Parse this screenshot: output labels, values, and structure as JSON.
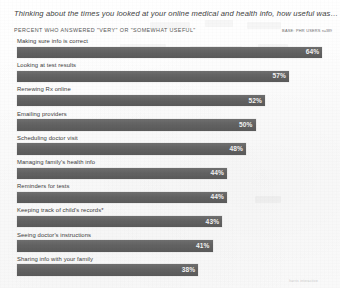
{
  "header": {
    "title": "Thinking about the times you looked at your online medical and health info, how useful was…",
    "subtitle": "PERCENT WHO ANSWERED \"VERY\" OR \"SOMEWHAT USEFUL\"",
    "base_label": "BASE: PHR USERS",
    "base_n": "n=389"
  },
  "footer": {
    "mark": "harris interactive"
  },
  "style": {
    "bar_color": "#636363",
    "value_color": "#f2f2f2",
    "page_color": "#fdfdfd",
    "label_color": "#3c3c3c"
  },
  "chart_data": {
    "type": "bar",
    "orientation": "horizontal",
    "title": "Thinking about the times you looked at your online medical and health info, how useful was…",
    "subtitle": "PERCENT WHO ANSWERED \"VERY\" OR \"SOMEWHAT USEFUL\"",
    "xlabel": "",
    "ylabel": "",
    "xlim": [
      0,
      64
    ],
    "grid": false,
    "legend": null,
    "value_suffix": "%",
    "categories": [
      "Making sure info is correct",
      "Looking at test results",
      "Renewing Rx online",
      "Emailing providers",
      "Scheduling doctor visit",
      "Managing family's health info",
      "Reminders for tests",
      "Keeping track of child's records*",
      "Seeing doctor's instructions",
      "Sharing info with your family"
    ],
    "values": [
      64,
      57,
      52,
      50,
      48,
      44,
      44,
      43,
      41,
      38
    ],
    "value_labels": [
      "64%",
      "57%",
      "52%",
      "50%",
      "48%",
      "44%",
      "44%",
      "43%",
      "41%",
      "38%"
    ]
  }
}
